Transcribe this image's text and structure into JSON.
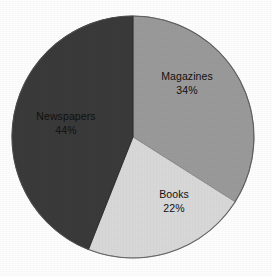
{
  "figure": {
    "background_color": "#fdfdfd",
    "width": 272,
    "height": 276
  },
  "chart_data": {
    "type": "pie",
    "title": "",
    "subtitle": "",
    "xlabel": "",
    "ylabel": "",
    "legend_position": "none",
    "grid": false,
    "labels_inside_slices": true,
    "start_angle_deg": 0,
    "direction": "clockwise",
    "categories": [
      "Magazines",
      "Books",
      "Newspapers"
    ],
    "values": [
      34,
      22,
      44
    ],
    "value_unit": "%",
    "colors": [
      "#9a9a9a",
      "#d8d8d8",
      "#3a3a3a"
    ],
    "slices": [
      {
        "label": "Magazines",
        "value": 34,
        "value_text": "34%",
        "color": "#9a9a9a",
        "start_angle_deg": 0,
        "end_angle_deg": 122.4
      },
      {
        "label": "Books",
        "value": 22,
        "value_text": "22%",
        "color": "#d8d8d8",
        "start_angle_deg": 122.4,
        "end_angle_deg": 201.6
      },
      {
        "label": "Newspapers",
        "value": 44,
        "value_text": "44%",
        "color": "#3a3a3a",
        "start_angle_deg": 201.6,
        "end_angle_deg": 360
      }
    ],
    "geometry": {
      "center_x": 133,
      "center_y": 137,
      "radius": 121,
      "outline_color": "#555555",
      "outline_width": 1
    }
  }
}
